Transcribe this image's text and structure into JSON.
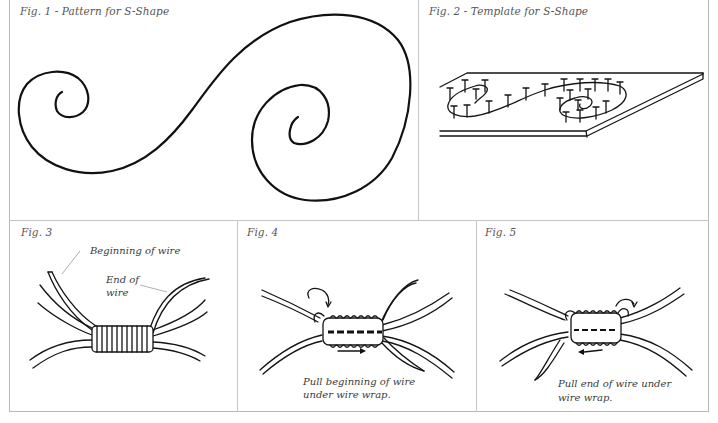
{
  "figures": [
    {
      "id": "fig1",
      "caption": "Fig. 1 - Pattern for S-Shape"
    },
    {
      "id": "fig2",
      "caption": "Fig. 2 - Template for S-Shape"
    },
    {
      "id": "fig3",
      "caption": "Fig. 3",
      "labels": {
        "beginning": "Beginning of wire",
        "end_line1": "End of",
        "end_line2": "wire"
      }
    },
    {
      "id": "fig4",
      "caption": "Fig. 4",
      "instruction_line1": "Pull beginning of wire",
      "instruction_line2": "under wire wrap."
    },
    {
      "id": "fig5",
      "caption": "Fig. 5",
      "instruction_line1": "Pull end of wire under",
      "instruction_line2": "wire wrap."
    }
  ],
  "colors": {
    "ink": "#111111",
    "border": "#b8b8b8",
    "caption": "#555555"
  }
}
